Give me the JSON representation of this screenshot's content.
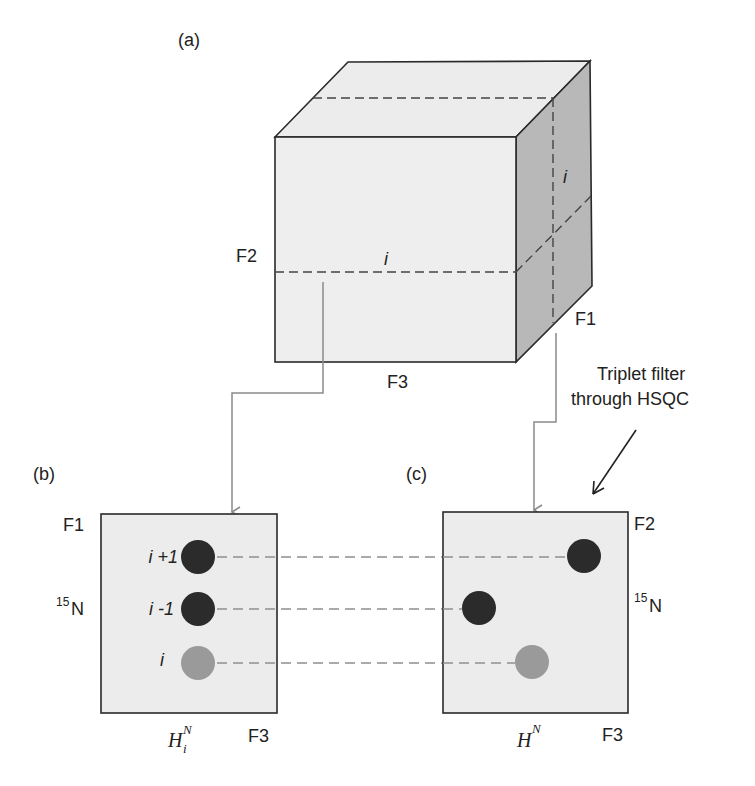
{
  "panels": {
    "a": {
      "label": "(a)"
    },
    "b": {
      "label": "(b)"
    },
    "c": {
      "label": "(c)"
    }
  },
  "cube": {
    "axis_left": "F2",
    "axis_bottom": "F3",
    "axis_right": "F1",
    "slice_front_label": "i",
    "slice_side_label": "i"
  },
  "annotation": {
    "line1": "Triplet filter",
    "line2": "through HSQC"
  },
  "plot_b": {
    "axis_top_left": "F1",
    "axis_left": "N",
    "axis_left_superscript": "15",
    "axis_bottom_right": "F3",
    "axis_bottom_main": "H",
    "axis_bottom_sub": "i",
    "axis_bottom_sup": "N",
    "peaks": [
      {
        "label": "i +1",
        "shade": "dark"
      },
      {
        "label": "i -1",
        "shade": "dark"
      },
      {
        "label": "i",
        "shade": "light"
      }
    ]
  },
  "plot_c": {
    "axis_top_right": "F2",
    "axis_right": "N",
    "axis_right_superscript": "15",
    "axis_bottom_right": "F3",
    "axis_bottom_main": "H",
    "axis_bottom_sup": "N",
    "peaks": [
      {
        "shade": "dark"
      },
      {
        "shade": "dark"
      },
      {
        "shade": "light"
      }
    ]
  },
  "colors": {
    "face_front": "#eeeeee",
    "face_top": "#ececec",
    "face_side": "#b5b5b5",
    "box_fill": "#ececec",
    "outline": "#2a2a2a",
    "dashed": "#444444",
    "connector": "#8a8a8a",
    "peak_dark": "#2b2b2b",
    "peak_light": "#9a9a9a",
    "guide_dashed": "#8f8f8f"
  }
}
